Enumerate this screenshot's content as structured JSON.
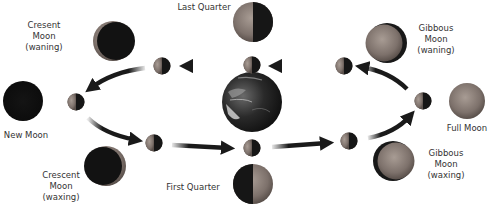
{
  "diagram": {
    "center": {
      "name": "Earth"
    },
    "phases": [
      {
        "id": "new-moon",
        "label": "New Moon",
        "illum": "none"
      },
      {
        "id": "crescent-waxing",
        "label": "Crescent\nMoon\n(waxing)",
        "illum": "crescent-right"
      },
      {
        "id": "first-quarter",
        "label": "First Quarter",
        "illum": "right-half"
      },
      {
        "id": "gibbous-waxing",
        "label": "Gibbous\nMoon\n(waxing)",
        "illum": "gibbous-right"
      },
      {
        "id": "full-moon",
        "label": "Full Moon",
        "illum": "full"
      },
      {
        "id": "gibbous-waning",
        "label": "Gibbous\nMoon\n(waning)",
        "illum": "gibbous-left"
      },
      {
        "id": "last-quarter",
        "label": "Last Quarter",
        "illum": "left-half"
      },
      {
        "id": "crescent-waning",
        "label": "Cresent\nMoon\n(waning)",
        "illum": "crescent-left"
      }
    ],
    "orbit_direction": "counterclockwise",
    "colors": {
      "moon_dark": "#111111",
      "moon_lit": "#8a7e78",
      "arrow": "#1a1a1a",
      "label_text": "#333333",
      "earth_dark": "#1e1e1e",
      "earth_light": "#cfcfcf"
    }
  }
}
